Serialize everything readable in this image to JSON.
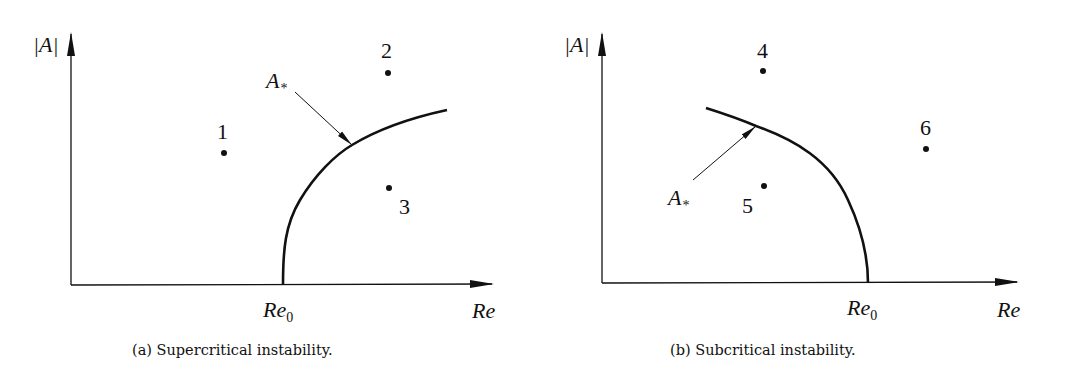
{
  "figure": {
    "panels": [
      {
        "id": "a",
        "caption": "(a) Supercritical instability.",
        "y_axis_label": "|A|",
        "x_axis_label": "Re",
        "critical_label": "Re",
        "critical_sub": "0",
        "curve_label": "A",
        "curve_label_sub": "*",
        "points": [
          {
            "label": "1"
          },
          {
            "label": "2"
          },
          {
            "label": "3"
          }
        ]
      },
      {
        "id": "b",
        "caption": "(b) Subcritical instability.",
        "y_axis_label": "|A|",
        "x_axis_label": "Re",
        "critical_label": "Re",
        "critical_sub": "0",
        "curve_label": "A",
        "curve_label_sub": "*",
        "points": [
          {
            "label": "4"
          },
          {
            "label": "5"
          },
          {
            "label": "6"
          }
        ]
      }
    ],
    "colors": {
      "ink": "#111111",
      "background": "#ffffff"
    }
  }
}
